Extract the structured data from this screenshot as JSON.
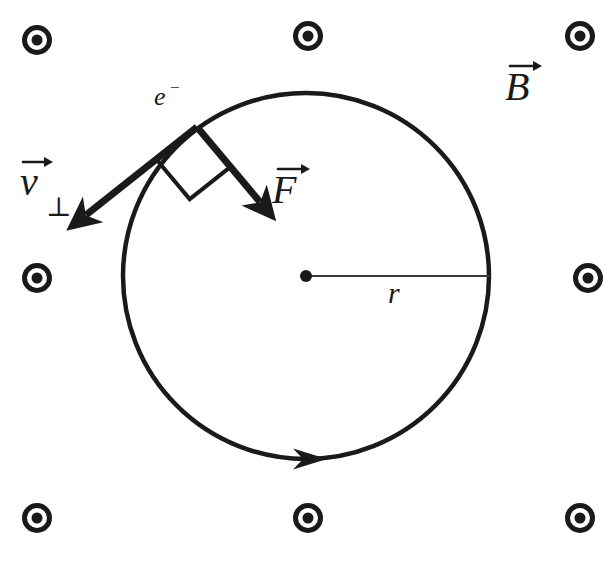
{
  "figure": {
    "type": "physics-diagram",
    "background_color": "#ffffff",
    "ink_color": "#1a1a1a",
    "width": 614,
    "height": 562
  },
  "labels": {
    "electron": "e",
    "electron_charge_sign": "−",
    "velocity_symbol": "v",
    "velocity_subscript": "⊥",
    "force_symbol": "F",
    "magnetic_field_symbol": "B",
    "radius_symbol": "r"
  },
  "geometry": {
    "circle": {
      "center_x": 306,
      "center_y": 276,
      "radius": 183,
      "stroke_width": 4.5
    },
    "center_dot": {
      "x": 306,
      "y": 276,
      "radius": 6
    },
    "radius_line": {
      "x1": 306,
      "y1": 276,
      "x2": 489,
      "y2": 276,
      "stroke_width": 2
    },
    "electron_point": {
      "x": 197,
      "y": 127,
      "radius": 9
    },
    "velocity_vector": {
      "x1": 197,
      "y1": 127,
      "x2": 86,
      "y2": 215,
      "stroke_width": 7,
      "direction": "tangential-down-left"
    },
    "force_vector": {
      "x1": 197,
      "y1": 127,
      "x2": 260,
      "y2": 202,
      "stroke_width": 7,
      "direction": "centripetal-down-right"
    },
    "right_angle_marker": {
      "vertex_x": 197,
      "vertex_y": 127,
      "arm_length": 52,
      "stroke_width": 4
    },
    "motion_arrow": {
      "x": 310,
      "y": 459,
      "direction": "clockwise"
    }
  },
  "field_dots": {
    "symbol_name": "field-out-of-page-dot",
    "outer_radius": 15,
    "ring_width": 5,
    "inner_radius": 5.5,
    "positions": [
      {
        "id": "dot-top-left",
        "x": 37,
        "y": 40
      },
      {
        "id": "dot-top-center",
        "x": 308,
        "y": 36
      },
      {
        "id": "dot-top-right",
        "x": 580,
        "y": 36
      },
      {
        "id": "dot-mid-left",
        "x": 37,
        "y": 278
      },
      {
        "id": "dot-mid-right",
        "x": 588,
        "y": 278
      },
      {
        "id": "dot-bottom-left",
        "x": 37,
        "y": 518
      },
      {
        "id": "dot-bottom-center",
        "x": 308,
        "y": 518
      },
      {
        "id": "dot-bottom-right",
        "x": 580,
        "y": 518
      }
    ]
  },
  "label_positions": {
    "electron": {
      "x": 154,
      "y": 105
    },
    "velocity": {
      "x": 20,
      "y": 195
    },
    "force": {
      "x": 272,
      "y": 203
    },
    "magnetic_field": {
      "x": 505,
      "y": 100
    },
    "radius": {
      "x": 388,
      "y": 303
    }
  }
}
